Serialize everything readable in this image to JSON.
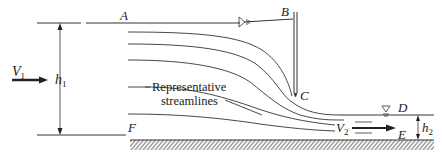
{
  "diagram": {
    "title": "",
    "labels": {
      "A": "A",
      "B": "B",
      "C": "C",
      "D": "D",
      "E": "E",
      "F": "F",
      "V1_main": "V",
      "V1_sub": "1",
      "V2_main": "V",
      "V2_sub": "2",
      "h1_main": "h",
      "h1_sub": "1",
      "h2_main": "h",
      "h2_sub": "2"
    },
    "annotation": {
      "line1": "Representative",
      "line2": "streamlines"
    },
    "symbols": {
      "upstream_free_surface": "free-surface-triangle",
      "downstream_free_surface": "free-surface-triangle"
    },
    "colors": {
      "ink": "#1a1a1a",
      "line": "#333333",
      "background": "#ffffff"
    }
  }
}
